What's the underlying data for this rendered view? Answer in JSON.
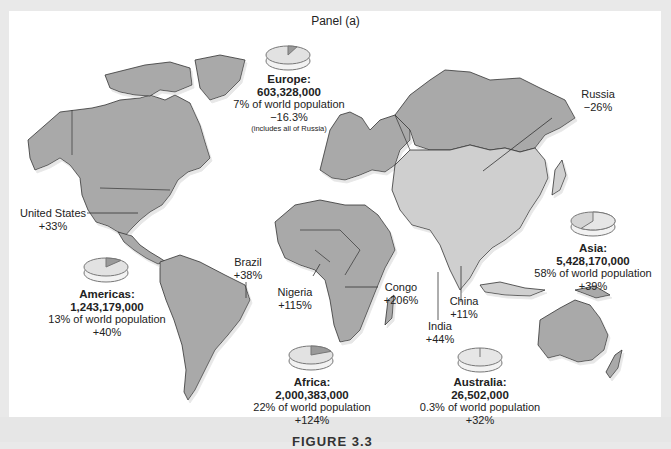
{
  "title": "Panel (a)",
  "figure_caption": "FIGURE 3.3",
  "colors": {
    "land": "#a9a9a9",
    "asia_land": "#cfcfcf",
    "border": "#333333",
    "ocean": "#ffffff",
    "frame": "#e9e9e9",
    "pie_main": "#e2e2e2",
    "pie_slice": "#9a9a9a"
  },
  "regions": [
    {
      "id": "europe",
      "name": "Europe:",
      "population": "603,328,000",
      "share": "7% of world population",
      "change": "−16.3%",
      "note": "(includes all of Russia)",
      "share_pct": 7
    },
    {
      "id": "americas",
      "name": "Americas:",
      "population": "1,243,179,000",
      "share": "13% of world population",
      "change": "+40%",
      "share_pct": 13
    },
    {
      "id": "africa",
      "name": "Africa:",
      "population": "2,000,383,000",
      "share": "22% of world population",
      "change": "+124%",
      "share_pct": 22
    },
    {
      "id": "asia",
      "name": "Asia:",
      "population": "5,428,170,000",
      "share": "58% of world population",
      "change": "+39%",
      "share_pct": 58
    },
    {
      "id": "australia",
      "name": "Australia:",
      "population": "26,502,000",
      "share": "0.3% of world population",
      "change": "+32%",
      "share_pct": 0.3
    }
  ],
  "countries": [
    {
      "name": "United States",
      "change": "+33%"
    },
    {
      "name": "Brazil",
      "change": "+38%"
    },
    {
      "name": "Nigeria",
      "change": "+115%"
    },
    {
      "name": "Congo",
      "change": "+206%"
    },
    {
      "name": "India",
      "change": "+44%"
    },
    {
      "name": "China",
      "change": "+11%"
    },
    {
      "name": "Russia",
      "change": "−26%"
    }
  ]
}
